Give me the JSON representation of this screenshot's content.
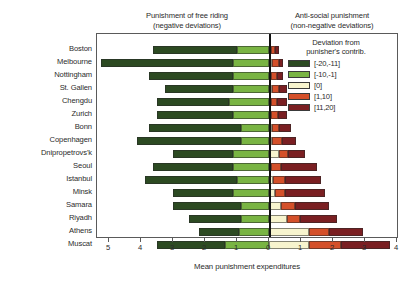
{
  "header": {
    "left_title_line1": "Punishment of free riding",
    "left_title_line2": "(negative deviations)",
    "right_title_line1": "Anti-social punishment",
    "right_title_line2": "(non-negative deviations)"
  },
  "legend": {
    "title_line1": "Deviation from",
    "title_line2": "punisher's contrib.",
    "entries": [
      {
        "label": "[-20,-11]",
        "color": "#2c4a22"
      },
      {
        "label": "[-10,-1]",
        "color": "#79b443"
      },
      {
        "label": "[0]",
        "color": "#f7f4ce"
      },
      {
        "label": "[1,10]",
        "color": "#d4502a"
      },
      {
        "label": "[11,20]",
        "color": "#7a1f22"
      }
    ]
  },
  "axis": {
    "title": "Mean punishment expenditures",
    "ticks": [
      "5",
      "4",
      "3",
      "2",
      "1",
      "0",
      "1",
      "2",
      "3",
      "4"
    ],
    "tick_values": [
      -5,
      -4,
      -3,
      -2,
      -1,
      0,
      1,
      2,
      3,
      4
    ],
    "xmin": -5.5,
    "xmax": 4.1
  },
  "chart_data": {
    "type": "bar",
    "orientation": "horizontal",
    "subtype": "diverging-stacked",
    "title": "",
    "xlabel": "Mean punishment expenditures",
    "ylabel": "",
    "xlim": [
      -5.5,
      4.1
    ],
    "grid": false,
    "legend_position": "top-right",
    "legend_title": "Deviation from punisher's contrib.",
    "categories": [
      "Boston",
      "Melbourne",
      "Nottingham",
      "St. Gallen",
      "Chengdu",
      "Zurich",
      "Bonn",
      "Copenhagen",
      "Dnipropetrovs'k",
      "Seoul",
      "Istanbul",
      "Minsk",
      "Samara",
      "Riyadh",
      "Athens",
      "Muscat"
    ],
    "series": [
      {
        "name": "[-20,-11]",
        "color": "#2c4a22",
        "values": [
          2.63,
          4.13,
          2.63,
          2.13,
          2.25,
          2.38,
          2.88,
          3.25,
          1.88,
          2.5,
          2.88,
          1.88,
          2.13,
          1.63,
          1.25,
          2.13
        ]
      },
      {
        "name": "[-10,-1]",
        "color": "#79b443",
        "values": [
          1.0,
          1.13,
          1.13,
          1.13,
          1.25,
          1.13,
          0.88,
          0.88,
          1.13,
          1.13,
          1.0,
          1.13,
          0.88,
          0.88,
          0.94,
          1.38
        ]
      },
      {
        "name": "[0]",
        "color": "#f7f4ce",
        "values": [
          0.06,
          0.09,
          0.06,
          0.09,
          0.06,
          0.06,
          0.09,
          0.09,
          0.31,
          0.06,
          0.13,
          0.19,
          0.38,
          0.56,
          1.25,
          1.25
        ]
      },
      {
        "name": "[1,10]",
        "color": "#d4502a",
        "values": [
          0.13,
          0.22,
          0.19,
          0.22,
          0.19,
          0.22,
          0.22,
          0.31,
          0.28,
          0.31,
          0.38,
          0.31,
          0.44,
          0.41,
          0.63,
          1.0
        ]
      },
      {
        "name": "[11,20]",
        "color": "#7a1f22",
        "values": [
          0.13,
          0.13,
          0.19,
          0.25,
          0.31,
          0.28,
          0.38,
          0.44,
          0.53,
          1.13,
          1.13,
          1.25,
          1.06,
          1.16,
          1.06,
          1.53
        ]
      }
    ]
  }
}
